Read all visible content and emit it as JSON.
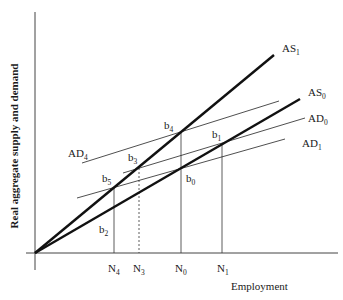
{
  "diagram": {
    "y_axis_label": "Real aggregate supply and demand",
    "x_axis_label": "Employment",
    "curves": [
      {
        "id": "AS1",
        "base": "AS",
        "sub": "1",
        "kind": "supply"
      },
      {
        "id": "AS0",
        "base": "AS",
        "sub": "0",
        "kind": "supply"
      },
      {
        "id": "AD0",
        "base": "AD",
        "sub": "0",
        "kind": "demand"
      },
      {
        "id": "AD1",
        "base": "AD",
        "sub": "1",
        "kind": "demand"
      },
      {
        "id": "AD4",
        "base": "AD",
        "sub": "4",
        "kind": "demand"
      }
    ],
    "points": [
      {
        "base": "b",
        "sub": "0"
      },
      {
        "base": "b",
        "sub": "1"
      },
      {
        "base": "b",
        "sub": "2"
      },
      {
        "base": "b",
        "sub": "3"
      },
      {
        "base": "b",
        "sub": "4"
      },
      {
        "base": "b",
        "sub": "5"
      }
    ],
    "employment_levels": [
      {
        "base": "N",
        "sub": "4",
        "style": "solid"
      },
      {
        "base": "N",
        "sub": "3",
        "style": "dashed"
      },
      {
        "base": "N",
        "sub": "0",
        "style": "solid"
      },
      {
        "base": "N",
        "sub": "1",
        "style": "solid"
      }
    ]
  }
}
